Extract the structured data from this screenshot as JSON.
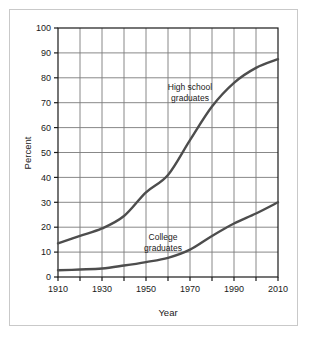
{
  "chart_data": {
    "type": "line",
    "title": "",
    "xlabel": "Year",
    "ylabel": "Percent",
    "xlim": [
      1910,
      2010
    ],
    "ylim": [
      0,
      100
    ],
    "grid": true,
    "legend_position": "inline-annotation",
    "xticks": [
      1910,
      1920,
      1930,
      1940,
      1950,
      1960,
      1970,
      1980,
      1990,
      2000,
      2010
    ],
    "xtick_labels": [
      "1910",
      "",
      "1930",
      "",
      "1950",
      "",
      "1970",
      "",
      "1990",
      "",
      "2010"
    ],
    "xtick_labels_major": [
      "1910",
      "1930",
      "1950",
      "1970",
      "1990",
      "2010"
    ],
    "yticks": [
      0,
      10,
      20,
      30,
      40,
      50,
      60,
      70,
      80,
      90,
      100
    ],
    "ytick_labels": [
      "0",
      "10",
      "20",
      "30",
      "40",
      "50",
      "60",
      "70",
      "80",
      "90",
      "100"
    ],
    "series": [
      {
        "name": "High school graduates",
        "annotation_line1": "High school",
        "annotation_line2": "graduates",
        "color": "#4d4d4d",
        "x": [
          1910,
          1920,
          1930,
          1940,
          1950,
          1960,
          1970,
          1980,
          1990,
          2000,
          2010
        ],
        "values": [
          13.5,
          16.5,
          19.5,
          24.5,
          34,
          41,
          55,
          68.5,
          78,
          84,
          87.5
        ]
      },
      {
        "name": "College graduates",
        "annotation_line1": "College",
        "annotation_line2": "graduates",
        "color": "#4d4d4d",
        "x": [
          1910,
          1920,
          1930,
          1940,
          1950,
          1960,
          1970,
          1980,
          1990,
          2000,
          2010
        ],
        "values": [
          2.7,
          3.0,
          3.4,
          4.6,
          6.0,
          7.7,
          11.0,
          16.5,
          21.5,
          25.5,
          30.0
        ]
      }
    ]
  },
  "axes": {
    "x_title": "Year",
    "y_title": "Percent"
  },
  "colors": {
    "line": "#4d4d4d",
    "grid": "#7a7a7a",
    "axis": "#1a1a1a",
    "border": "#c9c9c9",
    "background": "#ffffff"
  }
}
